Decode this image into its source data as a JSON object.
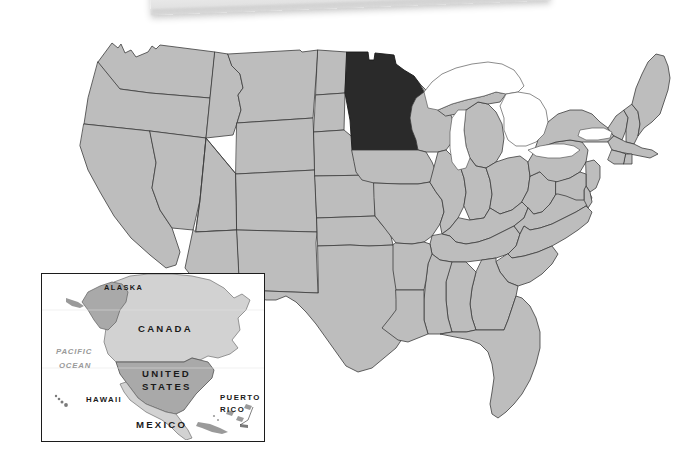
{
  "image": {
    "title": "United States map with Minnesota highlighted",
    "width": 687,
    "height": 470,
    "background_color": "#ffffff"
  },
  "colors": {
    "state_fill": "#bdbdbd",
    "state_border": "#3c3c3c",
    "highlight_fill": "#2a2a2a",
    "lake_fill": "#ffffff",
    "inset_border": "#1c1c1c",
    "inset_us_fill": "#a9a9a9",
    "inset_other_fill": "#d2d2d2",
    "ocean_label_color": "#9a9a9a",
    "label_color": "#1a1a1a",
    "paper_edge_color": "#e8e8e8"
  },
  "main_map": {
    "name": "united-states-map",
    "highlighted_state": "Minnesota",
    "highlighted_state_abbr": "MN",
    "water_features": [
      "Lake Superior",
      "Lake Michigan",
      "Lake Huron",
      "Lake Erie",
      "Lake Ontario"
    ],
    "states_count": 48,
    "projection": "contiguous-48"
  },
  "inset_map": {
    "name": "north-america-inset",
    "labels": [
      {
        "id": "alaska",
        "text": "ALASKA",
        "x": 62,
        "y": 10,
        "size": 7.4
      },
      {
        "id": "canada",
        "text": "CANADA",
        "x": 96,
        "y": 50,
        "size": 9.6
      },
      {
        "id": "pacific-ocean-line1",
        "text": "PACIFIC",
        "x": 14,
        "y": 73,
        "size": 7.8
      },
      {
        "id": "pacific-ocean-line2",
        "text": "OCEAN",
        "x": 17,
        "y": 87,
        "size": 7.8
      },
      {
        "id": "united-states-line1",
        "text": "UNITED",
        "x": 100,
        "y": 95,
        "size": 9.6
      },
      {
        "id": "united-states-line2",
        "text": "STATES",
        "x": 100,
        "y": 108,
        "size": 9.6
      },
      {
        "id": "hawaii",
        "text": "HAWAII",
        "x": 44,
        "y": 128,
        "size": 7.8
      },
      {
        "id": "puerto-rico-line1",
        "text": "PUERTO",
        "x": 182,
        "y": 126,
        "size": 7.8
      },
      {
        "id": "puerto-rico-line2",
        "text": "RICO",
        "x": 182,
        "y": 138,
        "size": 7.8
      },
      {
        "id": "mexico",
        "text": "MEXICO",
        "x": 94,
        "y": 152,
        "size": 9.6
      }
    ]
  }
}
